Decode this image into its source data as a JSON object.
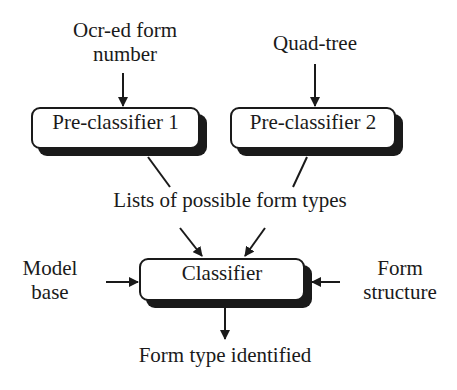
{
  "diagram": {
    "inputs": {
      "ocr": "Ocr-ed form number",
      "ocr_line1": "Ocr-ed form",
      "ocr_line2": "number",
      "quadtree": "Quad-tree",
      "model_line1": "Model",
      "model_line2": "base",
      "structure_line1": "Form",
      "structure_line2": "structure"
    },
    "nodes": {
      "pre1": "Pre-classifier 1",
      "pre2": "Pre-classifier 2",
      "classifier": "Classifier"
    },
    "intermediate": "Lists of possible form types",
    "output": "Form type identified",
    "edges": [
      {
        "from": "Ocr-ed form number",
        "to": "Pre-classifier 1"
      },
      {
        "from": "Quad-tree",
        "to": "Pre-classifier 2"
      },
      {
        "from": "Pre-classifier 1",
        "to": "Lists of possible form types"
      },
      {
        "from": "Pre-classifier 2",
        "to": "Lists of possible form types"
      },
      {
        "from": "Lists of possible form types",
        "to": "Classifier"
      },
      {
        "from": "Model base",
        "to": "Classifier"
      },
      {
        "from": "Form structure",
        "to": "Classifier"
      },
      {
        "from": "Classifier",
        "to": "Form type identified"
      }
    ]
  }
}
